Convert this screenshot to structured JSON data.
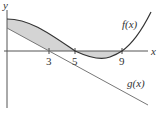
{
  "diagram": {
    "axes": {
      "x_label": "x",
      "y_label": "y"
    },
    "ticks": [
      {
        "label": "3",
        "value": 3
      },
      {
        "label": "5",
        "value": 5
      },
      {
        "label": "9",
        "value": 9
      }
    ],
    "curves": [
      {
        "name": "f(x)",
        "label": "f(x)",
        "type": "cubic-like",
        "x_intercepts": [
          5,
          9
        ]
      },
      {
        "name": "g(x)",
        "label": "g(x)",
        "type": "line",
        "x_intercept": 3
      }
    ],
    "shaded_region": "between f(x) and g(x) / x-axis from x=0 to x=9",
    "colors": {
      "curve": "#333333",
      "line": "#777777",
      "shade": "#d4d4d4",
      "axis": "#555555"
    }
  }
}
